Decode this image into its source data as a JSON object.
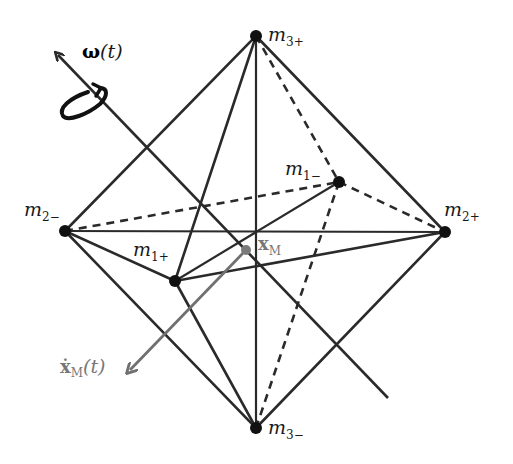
{
  "figure": {
    "colors": {
      "edge": "#2a2a2a",
      "vertex": "#111111",
      "center_of_mass": "#7a7a7a",
      "velocity_arrow": "#707070",
      "background": "#ffffff"
    },
    "vertices": [
      {
        "id": "m3+",
        "base": "m",
        "subscript": "3+",
        "x": 256,
        "y": 36
      },
      {
        "id": "m3-",
        "base": "m",
        "subscript": "3−",
        "x": 256,
        "y": 428
      },
      {
        "id": "m2-",
        "base": "m",
        "subscript": "2−",
        "x": 65,
        "y": 231
      },
      {
        "id": "m2+",
        "base": "m",
        "subscript": "2+",
        "x": 445,
        "y": 232
      },
      {
        "id": "m1+",
        "base": "m",
        "subscript": "1+",
        "x": 175,
        "y": 281
      },
      {
        "id": "m1-",
        "base": "m",
        "subscript": "1−",
        "x": 339,
        "y": 182
      }
    ],
    "center_of_mass": {
      "base": "x",
      "subscript": "M",
      "x": 246,
      "y": 250
    },
    "rotation_axis": {
      "label_base": "ω",
      "label_arg": "(t)"
    },
    "velocity": {
      "label_base": "ẋ",
      "label_sub": "M",
      "label_arg": "(t)"
    }
  }
}
